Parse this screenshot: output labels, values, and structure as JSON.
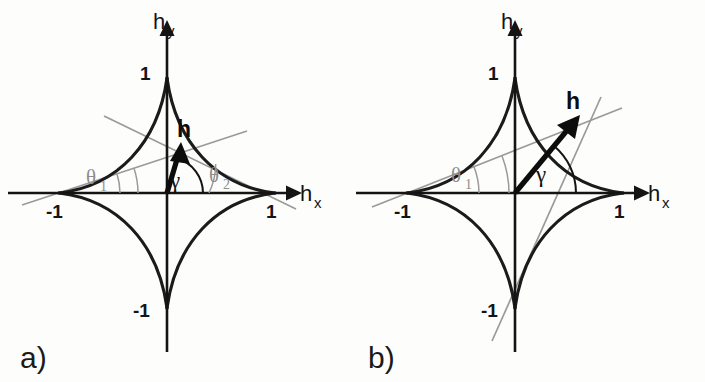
{
  "figure": {
    "type": "stoner-wohlfarth-astroid-pair",
    "background_color": "#fdfdfc",
    "curve_color": "#1b1b1b",
    "axis_color": "#141414",
    "construction_line_color": "#9a9a9a",
    "vector_color": "#0d0d0d"
  },
  "panels": [
    {
      "id": "a",
      "caption": "a)",
      "caption_pos": {
        "x": 20,
        "y": 368
      },
      "origin": {
        "x": 167,
        "y": 193
      },
      "radius_x": 108,
      "radius_y": 115,
      "axes": {
        "x": {
          "label": "h",
          "subscript": "x",
          "label_pos": {
            "x": 300,
            "y": 200
          },
          "sub_pos": {
            "x": 318,
            "y": 207
          },
          "start": {
            "x": 8,
            "y": 193
          },
          "end": {
            "x": 288,
            "y": 193
          }
        },
        "y": {
          "label": "h",
          "subscript": "y",
          "label_pos": {
            "x": 155,
            "y": 28
          },
          "sub_pos": {
            "x": 172,
            "y": 35
          },
          "start": {
            "x": 167,
            "y": 352
          },
          "end": {
            "x": 167,
            "y": 22
          }
        }
      },
      "ticks": [
        {
          "name": "x-neg-one",
          "text": "-1",
          "x": 48,
          "y": 216
        },
        {
          "name": "x-pos-one",
          "text": "1",
          "x": 267,
          "y": 216
        },
        {
          "name": "y-pos-one",
          "text": "1",
          "x": 140,
          "y": 79
        },
        {
          "name": "y-neg-one",
          "text": "-1",
          "x": 135,
          "y": 316
        }
      ],
      "vector": {
        "label": "h",
        "label_pos": {
          "x": 178,
          "y": 132
        },
        "tail": {
          "x": 167,
          "y": 193
        },
        "tip": {
          "x": 181,
          "y": 146
        },
        "angle_deg": 73
      },
      "angles": [
        {
          "name": "theta-1",
          "symbol": "θ",
          "subscript": "1",
          "label_pos": {
            "x": 90,
            "y": 182
          },
          "sub_pos": {
            "x": 103,
            "y": 189
          },
          "vertex": {
            "x": 58,
            "y": 193
          },
          "value_deg": 18,
          "arc_radius": 62,
          "color": "#9a9a9a"
        },
        {
          "name": "theta-2",
          "symbol": "θ",
          "subscript": "2",
          "label_pos": {
            "x": 211,
            "y": 180
          },
          "sub_pos": {
            "x": 224,
            "y": 187
          },
          "vertex": {
            "x": 275,
            "y": 193
          },
          "value_deg": 26,
          "arc_radius": 66,
          "color": "#9a9a9a"
        },
        {
          "name": "gamma",
          "symbol": "γ",
          "label_pos": {
            "x": 172,
            "y": 186
          },
          "vertex": {
            "x": 167,
            "y": 193
          },
          "value_deg": 73,
          "arc_radius": 36,
          "color": "#141414"
        }
      ],
      "construction_lines": [
        {
          "name": "tangent-from-left-cusp",
          "from": {
            "x": 22,
            "y": 205
          },
          "to": {
            "x": 247,
            "y": 131
          }
        },
        {
          "name": "tangent-from-right-cusp",
          "from": {
            "x": 104,
            "y": 116
          },
          "to": {
            "x": 296,
            "y": 209
          }
        }
      ]
    },
    {
      "id": "b",
      "caption": "b)",
      "caption_pos": {
        "x": 368,
        "y": 368
      },
      "origin": {
        "x": 515,
        "y": 193
      },
      "radius_x": 108,
      "radius_y": 115,
      "axes": {
        "x": {
          "label": "h",
          "subscript": "x",
          "label_pos": {
            "x": 648,
            "y": 200
          },
          "sub_pos": {
            "x": 666,
            "y": 207
          },
          "start": {
            "x": 356,
            "y": 193
          },
          "end": {
            "x": 636,
            "y": 193
          }
        },
        "y": {
          "label": "h",
          "subscript": "y",
          "label_pos": {
            "x": 503,
            "y": 28
          },
          "sub_pos": {
            "x": 520,
            "y": 35
          },
          "start": {
            "x": 515,
            "y": 352
          },
          "end": {
            "x": 515,
            "y": 22
          }
        }
      },
      "ticks": [
        {
          "name": "x-neg-one",
          "text": "-1",
          "x": 396,
          "y": 216
        },
        {
          "name": "x-pos-one",
          "text": "1",
          "x": 615,
          "y": 216
        },
        {
          "name": "y-pos-one",
          "text": "1",
          "x": 488,
          "y": 79
        },
        {
          "name": "y-neg-one",
          "text": "-1",
          "x": 483,
          "y": 316
        }
      ],
      "vector": {
        "label": "h",
        "label_pos": {
          "x": 567,
          "y": 104
        },
        "tail": {
          "x": 515,
          "y": 193
        },
        "tip": {
          "x": 578,
          "y": 117
        },
        "angle_deg": 50
      },
      "angles": [
        {
          "name": "theta-1",
          "symbol": "θ",
          "subscript": "1",
          "label_pos": {
            "x": 455,
            "y": 180
          },
          "sub_pos": {
            "x": 468,
            "y": 187
          },
          "vertex": {
            "x": 406,
            "y": 193
          },
          "value_deg": 21,
          "arc_radius": 103,
          "color": "#9a9a9a"
        },
        {
          "name": "gamma",
          "symbol": "γ",
          "label_pos": {
            "x": 538,
            "y": 180
          },
          "vertex": {
            "x": 515,
            "y": 193
          },
          "value_deg": 50,
          "arc_radius": 61,
          "color": "#141414"
        }
      ],
      "construction_lines": [
        {
          "name": "tangent-from-left-cusp",
          "from": {
            "x": 372,
            "y": 206
          },
          "to": {
            "x": 620,
            "y": 108
          }
        },
        {
          "name": "steep-tangent-line",
          "from": {
            "x": 492,
            "y": 340
          },
          "to": {
            "x": 600,
            "y": 98
          }
        }
      ]
    }
  ]
}
